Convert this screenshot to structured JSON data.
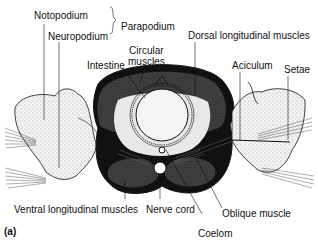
{
  "figure": {
    "letter": "(a)",
    "labels": {
      "notopodium": "Notopodium",
      "neuropodium": "Neuropodium",
      "parapodium": "Parapodium",
      "intestine": "Intestine",
      "circular_muscles_line1": "Circular",
      "circular_muscles_line2": "muscles",
      "dorsal_longitudinal_muscles": "Dorsal longitudinal muscles",
      "aciculum": "Aciculum",
      "setae": "Setae",
      "ventral_longitudinal_muscles": "Ventral longitudinal muscles",
      "nerve_cord": "Nerve cord",
      "oblique_muscle": "Oblique muscle",
      "coelom": "Coelom"
    }
  },
  "colors": {
    "ink": "#111111",
    "muscle_dark": "#3a3a3a",
    "muscle_mid": "#6b6b6b",
    "tissue_light": "#e6e6e6",
    "background": "#ffffff"
  }
}
